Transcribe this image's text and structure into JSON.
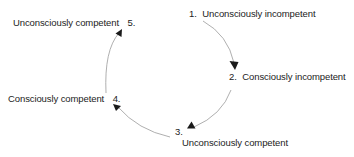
{
  "diagram": {
    "type": "cycle",
    "stages": [
      {
        "number": "1.",
        "label": "Unconsciously incompetent"
      },
      {
        "number": "2.",
        "label": "Consciously incompetent"
      },
      {
        "number": "3.",
        "label": "Unconsciously competent"
      },
      {
        "number": "4.",
        "label": "Consciously competent"
      },
      {
        "number": "5.",
        "label": "Unconsciously competent"
      }
    ],
    "edges": [
      {
        "from": "1",
        "to": "2"
      },
      {
        "from": "2",
        "to": "3"
      },
      {
        "from": "3",
        "to": "4"
      },
      {
        "from": "4",
        "to": "5"
      }
    ],
    "colors": {
      "text": "#222222",
      "line": "#9a9a9a",
      "arrowhead": "#1a1a1a"
    }
  }
}
